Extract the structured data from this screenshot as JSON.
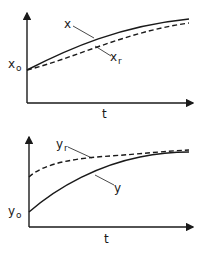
{
  "diagram": {
    "type": "response-curves",
    "panels": [
      {
        "id": "top",
        "y_axis_origin_label": "x",
        "y_axis_origin_sub": "o",
        "x_axis_label": "t",
        "curves": [
          {
            "name": "x",
            "label": "x",
            "sub": "",
            "style": "solid"
          },
          {
            "name": "x_r",
            "label": "x",
            "sub": "r",
            "style": "dashed"
          }
        ]
      },
      {
        "id": "bottom",
        "y_axis_origin_label": "y",
        "y_axis_origin_sub": "o",
        "x_axis_label": "t",
        "curves": [
          {
            "name": "y_r",
            "label": "y",
            "sub": "r",
            "style": "dashed"
          },
          {
            "name": "y",
            "label": "y",
            "sub": "",
            "style": "solid"
          }
        ]
      }
    ]
  },
  "colors": {
    "ink": "#1a1a1a",
    "background": "#ffffff"
  }
}
